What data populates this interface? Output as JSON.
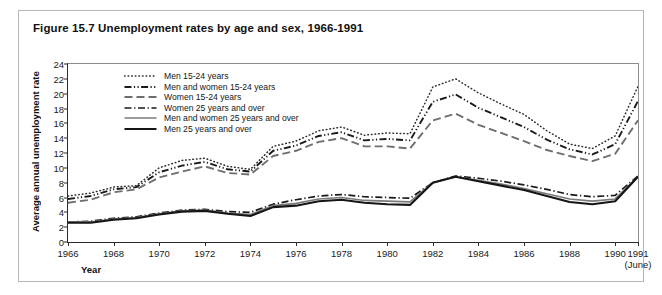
{
  "figure": {
    "title": "Figure 15.7 Unemployment rates by age and sex, 1966-1991"
  },
  "axes": {
    "ylabel": "Average annual unemployment rate",
    "xlabel": "Year",
    "x_end_note": "(June)"
  },
  "chart_data": {
    "type": "line",
    "title": "Figure 15.7 Unemployment rates by age and sex, 1966-1991",
    "xlabel": "Year",
    "ylabel": "Average annual unemployment rate",
    "xlim": [
      1966,
      1991
    ],
    "ylim": [
      0,
      24
    ],
    "yticks": [
      0,
      2,
      4,
      6,
      8,
      10,
      12,
      14,
      16,
      18,
      20,
      22,
      24
    ],
    "xticks": [
      1966,
      1968,
      1970,
      1972,
      1974,
      1976,
      1978,
      1980,
      1982,
      1984,
      1986,
      1988,
      1990,
      1991
    ],
    "xticklabels": [
      "1966",
      "1968",
      "1970",
      "1972",
      "1974",
      "1976",
      "1978",
      "1980",
      "1982",
      "1984",
      "1986",
      "1988",
      "1990",
      "1991"
    ],
    "x_end_note": "(June)",
    "grid": false,
    "legend_position": "upper left",
    "x": [
      1966,
      1967,
      1968,
      1969,
      1970,
      1971,
      1972,
      1973,
      1974,
      1975,
      1976,
      1977,
      1978,
      1979,
      1980,
      1981,
      1982,
      1983,
      1984,
      1985,
      1986,
      1987,
      1988,
      1989,
      1990,
      1991
    ],
    "series": [
      {
        "name": "Men 15-24 years",
        "style": "dotted",
        "color": "#2b2b2b",
        "values": [
          6.2,
          6.6,
          7.4,
          7.6,
          10.0,
          11.0,
          11.3,
          10.2,
          9.8,
          12.9,
          13.6,
          15.0,
          15.5,
          14.4,
          14.7,
          14.6,
          20.9,
          22.0,
          20.1,
          18.6,
          17.2,
          15.0,
          13.2,
          12.6,
          14.3,
          21.0
        ]
      },
      {
        "name": "Men and women 15-24 years",
        "style": "dash-dot-dot",
        "color": "#1a1a1a",
        "values": [
          5.8,
          6.2,
          7.1,
          7.4,
          9.4,
          10.3,
          10.8,
          9.8,
          9.5,
          12.3,
          13.0,
          14.3,
          14.8,
          13.7,
          13.9,
          13.7,
          18.9,
          19.9,
          18.1,
          16.8,
          15.5,
          13.8,
          12.5,
          11.8,
          13.2,
          19.0
        ]
      },
      {
        "name": "Women 15-24 years",
        "style": "long-dash",
        "color": "#6e6e6e",
        "values": [
          5.3,
          5.7,
          6.7,
          7.1,
          8.7,
          9.5,
          10.2,
          9.3,
          9.1,
          11.6,
          12.3,
          13.5,
          14.0,
          12.9,
          12.9,
          12.6,
          16.4,
          17.3,
          15.8,
          14.7,
          13.6,
          12.4,
          11.6,
          10.9,
          11.9,
          16.4
        ]
      },
      {
        "name": "Women 25 years and over",
        "style": "dash-dot",
        "color": "#1a1a1a",
        "values": [
          2.7,
          2.8,
          3.2,
          3.4,
          3.9,
          4.3,
          4.4,
          4.1,
          4.0,
          5.1,
          5.7,
          6.2,
          6.4,
          6.1,
          6.0,
          5.9,
          8.0,
          8.9,
          8.6,
          8.2,
          7.7,
          7.1,
          6.4,
          6.1,
          6.3,
          8.9
        ]
      },
      {
        "name": "Men and women 25 years and over",
        "style": "solid",
        "color": "#7a7a7a",
        "values": [
          2.7,
          2.7,
          3.1,
          3.3,
          3.8,
          4.2,
          4.3,
          3.9,
          3.7,
          4.9,
          5.2,
          5.8,
          6.0,
          5.6,
          5.5,
          5.4,
          8.0,
          8.8,
          8.3,
          7.8,
          7.2,
          6.5,
          5.8,
          5.5,
          5.8,
          8.8
        ]
      },
      {
        "name": "Men 25 years and over",
        "style": "solid-thick",
        "color": "#151515",
        "values": [
          2.6,
          2.6,
          3.0,
          3.2,
          3.7,
          4.1,
          4.2,
          3.8,
          3.5,
          4.7,
          4.9,
          5.5,
          5.7,
          5.3,
          5.1,
          5.0,
          8.0,
          8.8,
          8.2,
          7.6,
          7.0,
          6.2,
          5.4,
          5.1,
          5.5,
          8.8
        ]
      }
    ]
  }
}
